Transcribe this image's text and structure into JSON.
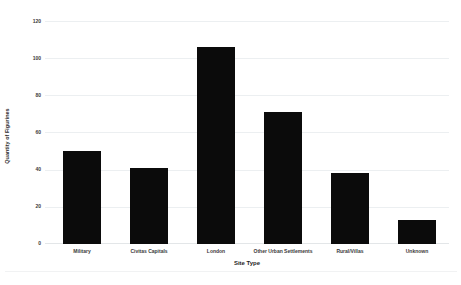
{
  "chart_data": {
    "type": "bar",
    "title": "",
    "subtitle": "",
    "xlabel": "Site Type",
    "ylabel": "Quantity of Figurines",
    "categories": [
      "Military",
      "Civitas Capitals",
      "London",
      "Other Urban Settlements",
      "Rural/Villas",
      "Unknown"
    ],
    "values": [
      50,
      41,
      106,
      71,
      38,
      13
    ],
    "series": [
      {
        "name": "Quantity of Figurines",
        "values": [
          50,
          41,
          106,
          71,
          38,
          13
        ]
      }
    ],
    "ylim": [
      0,
      120
    ],
    "yticks": [
      0,
      20,
      40,
      60,
      80,
      100,
      120
    ],
    "ytick_labels": [
      "0",
      "20",
      "40",
      "60",
      "80",
      "100",
      "120"
    ],
    "grid": "horizontal",
    "legend": "none",
    "bar_color": "#0b0b0b",
    "gridline_color": "#eceff1",
    "background_color": "#ffffff",
    "annotations": []
  }
}
